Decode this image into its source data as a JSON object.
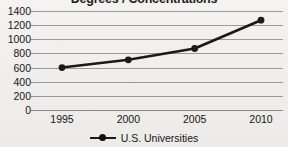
{
  "chart_data": {
    "type": "line",
    "title": "Degrees / Concentrations",
    "xlabel": "",
    "ylabel": "",
    "categories": [
      "1995",
      "2000",
      "2005",
      "2010"
    ],
    "x": [
      1995,
      2000,
      2005,
      2010
    ],
    "series": [
      {
        "name": "U.S. Universities",
        "values": [
          600,
          710,
          870,
          1270
        ],
        "color": "#1a1a1a",
        "marker": "circle"
      }
    ],
    "ylim": [
      0,
      1400
    ],
    "ytick_step": 200,
    "ytick_labels": [
      "1400",
      "1200",
      "1000",
      "800",
      "600",
      "400",
      "200",
      "0"
    ],
    "ytick_values": [
      1400,
      1200,
      1000,
      800,
      600,
      400,
      200,
      0
    ],
    "xtick_labels": [
      "1995",
      "2000",
      "2005",
      "2010"
    ],
    "grid": "horizontal",
    "grid_color": "#9d9b98",
    "legend_position": "bottom-center",
    "legend_entries": [
      "U.S. Universities"
    ],
    "annotations": [],
    "background_color": "#f1f0ee",
    "title_clipped_top": true
  },
  "legend": {
    "marker_name": "line-with-circle-marker",
    "label": "U.S. Universities"
  }
}
